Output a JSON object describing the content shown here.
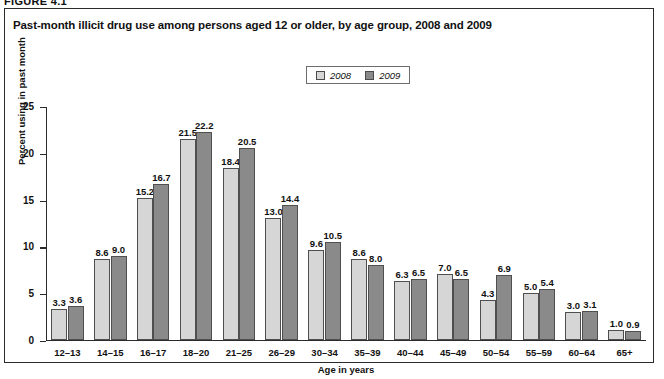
{
  "figure": {
    "label": "FIGURE 4.1",
    "title": "Past-month illicit drug use among persons aged 12 or older, by age group, 2008 and 2009"
  },
  "legend": {
    "position": "top-center",
    "entries": [
      {
        "label": "2008",
        "color": "#d6d6d6"
      },
      {
        "label": "2009",
        "color": "#8a8a8a"
      }
    ]
  },
  "chart_data": {
    "type": "bar",
    "title": "Past-month illicit drug use among persons aged 12 or older, by age group, 2008 and 2009",
    "xlabel": "Age in years",
    "ylabel": "Percent using in past month",
    "ylim": [
      0,
      25
    ],
    "yticks": [
      0,
      5,
      10,
      15,
      20,
      25
    ],
    "grid": false,
    "legend_position": "top-center",
    "categories": [
      "12–13",
      "14–15",
      "16–17",
      "18–20",
      "21–25",
      "26–29",
      "30–34",
      "35–39",
      "40–44",
      "45–49",
      "50–54",
      "55–59",
      "60–64",
      "65+"
    ],
    "series": [
      {
        "name": "2008",
        "color": "#d6d6d6",
        "values": [
          3.3,
          8.6,
          15.2,
          21.5,
          18.4,
          13.0,
          9.6,
          8.6,
          6.3,
          7.0,
          4.3,
          5.0,
          3.0,
          1.0
        ],
        "labels": [
          "3.3",
          "8.6",
          "15.2",
          "21.5",
          "18.4",
          "13.0",
          "9.6",
          "8.6",
          "6.3",
          "7.0",
          "4.3",
          "5.0",
          "3.0",
          "1.0"
        ]
      },
      {
        "name": "2009",
        "color": "#8a8a8a",
        "values": [
          3.6,
          9.0,
          16.7,
          22.2,
          20.5,
          14.4,
          10.5,
          8.0,
          6.5,
          6.5,
          6.9,
          5.4,
          3.1,
          0.9
        ],
        "labels": [
          "3.6",
          "9.0",
          "16.7",
          "22.2",
          "20.5",
          "14.4",
          "10.5",
          "8.0",
          "6.5",
          "6.5",
          "6.9",
          "5.4",
          "3.1",
          "0.9"
        ]
      }
    ]
  }
}
